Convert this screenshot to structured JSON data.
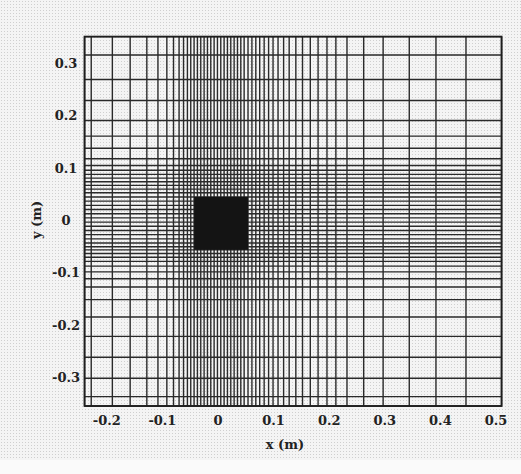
{
  "chart_data": {
    "type": "mesh",
    "title": "",
    "xlabel": "x (m)",
    "ylabel": "y (m)",
    "xlim": [
      -0.24,
      0.51
    ],
    "ylim": [
      -0.355,
      0.35
    ],
    "grid": true,
    "legend": null,
    "x_ticks": [
      -0.2,
      -0.1,
      0,
      0.1,
      0.2,
      0.3,
      0.4,
      0.5
    ],
    "x_tick_labels": [
      "-0.2",
      "-0.1",
      "0",
      "0.1",
      "0.2",
      "0.3",
      "0.4",
      "0.5"
    ],
    "y_ticks": [
      0.3,
      0.2,
      0.1,
      0,
      -0.1,
      -0.2,
      -0.3
    ],
    "y_tick_labels": [
      "0.3",
      "0.2",
      "0.1",
      "0",
      "-0.1",
      "-0.2",
      "-0.3"
    ],
    "mesh_x_lines": [
      -0.24,
      -0.228,
      -0.19,
      -0.158,
      -0.128,
      -0.108,
      -0.092,
      -0.08,
      -0.07,
      -0.062,
      -0.055,
      -0.049,
      -0.043,
      -0.037,
      -0.031,
      -0.025,
      -0.019,
      -0.013,
      -0.007,
      -0.001,
      0.005,
      0.011,
      0.017,
      0.023,
      0.029,
      0.035,
      0.041,
      0.047,
      0.054,
      0.061,
      0.068,
      0.075,
      0.083,
      0.091,
      0.099,
      0.108,
      0.118,
      0.128,
      0.14,
      0.152,
      0.166,
      0.18,
      0.196,
      0.212,
      0.232,
      0.262,
      0.297,
      0.344,
      0.392,
      0.446,
      0.51
    ],
    "mesh_y_lines": [
      0.35,
      0.315,
      0.268,
      0.228,
      0.19,
      0.16,
      0.137,
      0.117,
      0.104,
      0.095,
      0.087,
      0.08,
      0.073,
      0.066,
      0.059,
      0.052,
      0.044,
      0.036,
      0.028,
      0.02,
      0.012,
      0.004,
      -0.004,
      -0.012,
      -0.02,
      -0.028,
      -0.036,
      -0.044,
      -0.051,
      -0.057,
      -0.064,
      -0.071,
      -0.079,
      -0.088,
      -0.099,
      -0.112,
      -0.128,
      -0.152,
      -0.185,
      -0.222,
      -0.262,
      -0.302,
      -0.337,
      -0.355
    ],
    "obstacle": {
      "label": "solid block",
      "x_range": [
        -0.043,
        0.054
      ],
      "y_range": [
        -0.057,
        0.044
      ],
      "color": "#141414"
    },
    "colors": {
      "line": "#2a2a2a",
      "frame": "#1e1e1e",
      "obstacle": "#141414",
      "background": "#f4f4f4"
    }
  },
  "axes": {
    "xlabel": "x (m)",
    "ylabel": "y (m)"
  }
}
